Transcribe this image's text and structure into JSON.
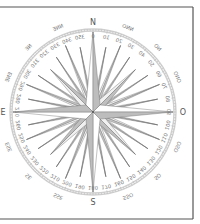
{
  "diagram": {
    "mirrored": true,
    "center": {
      "x": 93,
      "y": 112
    },
    "colors": {
      "frame": "#555555",
      "ring": "#cfcfcf",
      "star_light": "#ffffff",
      "star_dark": "#bdbdbd",
      "star_outline": "#666666",
      "text": "#777777"
    },
    "cardinals": [
      {
        "label": "N",
        "angle": 0
      },
      {
        "label": "O",
        "angle": 90
      },
      {
        "label": "S",
        "angle": 180
      },
      {
        "label": "E",
        "angle": 270
      }
    ],
    "intercardinals": [
      {
        "label": "NNO",
        "angle": 22.5
      },
      {
        "label": "NO",
        "angle": 45
      },
      {
        "label": "ONO",
        "angle": 67.5
      },
      {
        "label": "OSO",
        "angle": 112.5
      },
      {
        "label": "SO",
        "angle": 135
      },
      {
        "label": "SSO",
        "angle": 157.5
      },
      {
        "label": "SSE",
        "angle": 202.5
      },
      {
        "label": "SE",
        "angle": 225
      },
      {
        "label": "ESE",
        "angle": 247.5
      },
      {
        "label": "ENE",
        "angle": 292.5
      },
      {
        "label": "NE",
        "angle": 315
      },
      {
        "label": "NNE",
        "angle": 337.5
      }
    ],
    "degree_labels": [
      "0",
      "10",
      "20",
      "30",
      "40",
      "50",
      "60",
      "70",
      "80",
      "90",
      "100",
      "110",
      "120",
      "130",
      "140",
      "150",
      "160",
      "170",
      "180",
      "190",
      "200",
      "210",
      "220",
      "230",
      "240",
      "250",
      "260",
      "270",
      "280",
      "290",
      "300",
      "310",
      "320",
      "330",
      "340",
      "350"
    ]
  }
}
